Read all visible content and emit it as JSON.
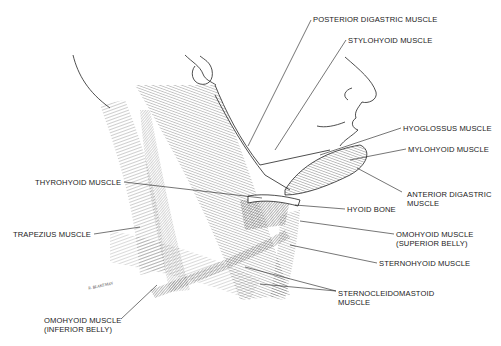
{
  "figure": {
    "signature": "R. BLAKEMAN"
  },
  "labels": {
    "posterior_digastric": [
      "POSTERIOR DIGASTRIC MUSCLE"
    ],
    "stylohyoid": [
      "STYLOHYOID MUSCLE"
    ],
    "hyoglossus": [
      "HYOGLOSSUS MUSCLE"
    ],
    "mylohyoid": [
      "MYLOHYOID MUSCLE"
    ],
    "anterior_digastric": [
      "ANTERIOR DIGASTRIC",
      "MUSCLE"
    ],
    "thyrohyoid": [
      "THYROHYOID MUSCLE"
    ],
    "hyoid_bone": [
      "HYOID BONE"
    ],
    "trapezius": [
      "TRAPEZIUS MUSCLE"
    ],
    "omohyoid_superior": [
      "OMOHYOID MUSCLE",
      "(SUPERIOR BELLY)"
    ],
    "sternohyoid": [
      "STERNOHYOID MUSCLE"
    ],
    "sternocleidomastoid": [
      "STERNOCLEIDOMASTOID",
      "MUSCLE"
    ],
    "omohyoid_inferior": [
      "OMOHYOID MUSCLE",
      "(INFERIOR BELLY)"
    ]
  },
  "colors": {
    "ink": "#1a1a1a",
    "background": "#ffffff"
  }
}
